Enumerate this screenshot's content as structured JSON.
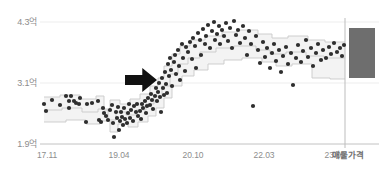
{
  "chart_data": {
    "type": "scatter",
    "title": "",
    "subtitle": "",
    "xlabel": "",
    "ylabel": "",
    "grid": true,
    "legend_position": "none",
    "xlim": [
      "17.11",
      "24.03"
    ],
    "ylim": [
      1.9,
      4.3
    ],
    "y_unit": "억",
    "y_ticks": [
      {
        "value": 4.3,
        "label": "4.3억",
        "pixel_y": 22
      },
      {
        "value": 3.1,
        "label": "3.1억",
        "pixel_y": 83
      },
      {
        "value": 1.9,
        "label": "1.9억",
        "pixel_y": 144
      }
    ],
    "x_ticks": [
      {
        "label": "17.11",
        "pixel_x": 46
      },
      {
        "label": "19.04",
        "pixel_x": 118
      },
      {
        "label": "20.10",
        "pixel_x": 192
      },
      {
        "label": "22.03",
        "pixel_x": 263
      },
      {
        "label": "23.09",
        "pixel_x": 334
      }
    ],
    "x_axis_end_label": "매물가격",
    "colors": {
      "point": "#2e2e2e",
      "step_line": "#c9c9c9",
      "band_fill": "#f3f3f3",
      "gridline": "#ededed",
      "axis_line": "#d6d6d6",
      "tick_text": "#8d8d8d",
      "arrow": "#111111",
      "listing_bar": "#6e6e6e",
      "divider": "#bdbdbd",
      "background": "#ffffff"
    },
    "annotations": [
      {
        "name": "trend-arrow",
        "shape": "right-arrow",
        "color": "#111111",
        "x": 125,
        "y": 68,
        "width": 32,
        "height": 24
      }
    ],
    "listing_price_bar": {
      "label": "매물가격",
      "x": 349,
      "width": 26,
      "top_value": 4.08,
      "bottom_value": 3.45,
      "top_pixel_y": 28,
      "bottom_pixel_y": 78,
      "color": "#6e6e6e"
    },
    "divider_line": {
      "pixel_x": 345,
      "top": 18,
      "bottom": 148
    },
    "series": [
      {
        "name": "실거래가",
        "type": "scatter",
        "marker": "circle",
        "marker_size": 3,
        "color": "#2e2e2e",
        "points": [
          [
            44,
            104
          ],
          [
            46,
            111
          ],
          [
            52,
            100
          ],
          [
            60,
            105
          ],
          [
            66,
            96
          ],
          [
            69,
            101
          ],
          [
            69,
            108
          ],
          [
            71,
            96
          ],
          [
            74,
            101
          ],
          [
            76,
            103
          ],
          [
            79,
            104
          ],
          [
            80,
            98
          ],
          [
            86,
            122
          ],
          [
            87,
            104
          ],
          [
            92,
            103
          ],
          [
            98,
            101
          ],
          [
            99,
            120
          ],
          [
            101,
            122
          ],
          [
            103,
            108
          ],
          [
            104,
            113
          ],
          [
            106,
            116
          ],
          [
            108,
            120
          ],
          [
            110,
            110
          ],
          [
            112,
            105
          ],
          [
            113,
            123
          ],
          [
            114,
            137
          ],
          [
            116,
            112
          ],
          [
            117,
            118
          ],
          [
            118,
            107
          ],
          [
            119,
            130
          ],
          [
            120,
            121
          ],
          [
            121,
            112
          ],
          [
            122,
            117
          ],
          [
            123,
            125
          ],
          [
            124,
            108
          ],
          [
            125,
            119
          ],
          [
            127,
            123
          ],
          [
            128,
            113
          ],
          [
            129,
            104
          ],
          [
            130,
            118
          ],
          [
            131,
            110
          ],
          [
            133,
            121
          ],
          [
            134,
            106
          ],
          [
            136,
            112
          ],
          [
            137,
            104
          ],
          [
            138,
            116
          ],
          [
            140,
            111
          ],
          [
            141,
            119
          ],
          [
            142,
            104
          ],
          [
            143,
            108
          ],
          [
            145,
            101
          ],
          [
            146,
            113
          ],
          [
            147,
            106
          ],
          [
            148,
            98
          ],
          [
            150,
            105
          ],
          [
            151,
            94
          ],
          [
            152,
            100
          ],
          [
            153,
            109
          ],
          [
            155,
            96
          ],
          [
            156,
            88
          ],
          [
            157,
            101
          ],
          [
            158,
            92
          ],
          [
            159,
            83
          ],
          [
            160,
            97
          ],
          [
            161,
            112
          ],
          [
            162,
            78
          ],
          [
            163,
            88
          ],
          [
            164,
            95
          ],
          [
            165,
            72
          ],
          [
            166,
            84
          ],
          [
            167,
            93
          ],
          [
            168,
            64
          ],
          [
            169,
            76
          ],
          [
            170,
            58
          ],
          [
            171,
            70
          ],
          [
            172,
            86
          ],
          [
            174,
            62
          ],
          [
            175,
            55
          ],
          [
            176,
            74
          ],
          [
            178,
            50
          ],
          [
            179,
            66
          ],
          [
            180,
            80
          ],
          [
            182,
            44
          ],
          [
            183,
            58
          ],
          [
            185,
            71
          ],
          [
            186,
            47
          ],
          [
            188,
            52
          ],
          [
            190,
            42
          ],
          [
            192,
            59
          ],
          [
            193,
            38
          ],
          [
            195,
            46
          ],
          [
            196,
            68
          ],
          [
            198,
            33
          ],
          [
            200,
            40
          ],
          [
            201,
            55
          ],
          [
            203,
            29
          ],
          [
            205,
            44
          ],
          [
            206,
            36
          ],
          [
            208,
            25
          ],
          [
            210,
            48
          ],
          [
            212,
            31
          ],
          [
            214,
            22
          ],
          [
            215,
            40
          ],
          [
            217,
            34
          ],
          [
            219,
            26
          ],
          [
            220,
            44
          ],
          [
            222,
            30
          ],
          [
            224,
            36
          ],
          [
            226,
            23
          ],
          [
            228,
            41
          ],
          [
            230,
            28
          ],
          [
            232,
            48
          ],
          [
            234,
            21
          ],
          [
            236,
            35
          ],
          [
            238,
            30
          ],
          [
            240,
            43
          ],
          [
            243,
            26
          ],
          [
            245,
            38
          ],
          [
            247,
            55
          ],
          [
            249,
            31
          ],
          [
            251,
            44
          ],
          [
            253,
            106
          ],
          [
            256,
            36
          ],
          [
            258,
            50
          ],
          [
            260,
            63
          ],
          [
            263,
            42
          ],
          [
            265,
            57
          ],
          [
            267,
            48
          ],
          [
            270,
            68
          ],
          [
            272,
            53
          ],
          [
            274,
            44
          ],
          [
            276,
            61
          ],
          [
            279,
            50
          ],
          [
            281,
            72
          ],
          [
            283,
            56
          ],
          [
            286,
            47
          ],
          [
            288,
            64
          ],
          [
            291,
            53
          ],
          [
            293,
            85
          ],
          [
            296,
            58
          ],
          [
            298,
            45
          ],
          [
            301,
            62
          ],
          [
            303,
            51
          ],
          [
            306,
            40
          ],
          [
            308,
            57
          ],
          [
            311,
            48
          ],
          [
            313,
            66
          ],
          [
            316,
            53
          ],
          [
            318,
            44
          ],
          [
            321,
            60
          ],
          [
            323,
            50
          ],
          [
            326,
            58
          ],
          [
            329,
            47
          ],
          [
            331,
            54
          ],
          [
            334,
            43
          ],
          [
            337,
            52
          ],
          [
            340,
            48
          ],
          [
            342,
            56
          ],
          [
            344,
            45
          ]
        ]
      },
      {
        "name": "상한선",
        "type": "step",
        "color": "#c9c9c9",
        "points": [
          [
            44,
            97
          ],
          [
            60,
            97
          ],
          [
            60,
            95
          ],
          [
            80,
            95
          ],
          [
            80,
            99
          ],
          [
            96,
            99
          ],
          [
            96,
            96
          ],
          [
            104,
            96
          ],
          [
            104,
            110
          ],
          [
            110,
            110
          ],
          [
            110,
            100
          ],
          [
            120,
            100
          ],
          [
            120,
            104
          ],
          [
            130,
            104
          ],
          [
            130,
            99
          ],
          [
            140,
            99
          ],
          [
            140,
            94
          ],
          [
            150,
            94
          ],
          [
            150,
            86
          ],
          [
            158,
            86
          ],
          [
            158,
            78
          ],
          [
            164,
            78
          ],
          [
            164,
            66
          ],
          [
            172,
            66
          ],
          [
            172,
            54
          ],
          [
            180,
            54
          ],
          [
            180,
            46
          ],
          [
            190,
            46
          ],
          [
            190,
            40
          ],
          [
            205,
            40
          ],
          [
            205,
            36
          ],
          [
            222,
            36
          ],
          [
            222,
            32
          ],
          [
            238,
            32
          ],
          [
            238,
            30
          ],
          [
            258,
            30
          ],
          [
            258,
            34
          ],
          [
            272,
            34
          ],
          [
            272,
            38
          ],
          [
            288,
            38
          ],
          [
            288,
            36
          ],
          [
            308,
            36
          ],
          [
            308,
            40
          ],
          [
            325,
            40
          ],
          [
            325,
            42
          ],
          [
            345,
            42
          ]
        ]
      },
      {
        "name": "중간값",
        "type": "step",
        "color": "#c9c9c9",
        "points": [
          [
            44,
            110
          ],
          [
            62,
            110
          ],
          [
            62,
            108
          ],
          [
            82,
            108
          ],
          [
            82,
            112
          ],
          [
            98,
            112
          ],
          [
            98,
            109
          ],
          [
            108,
            109
          ],
          [
            108,
            120
          ],
          [
            116,
            120
          ],
          [
            116,
            112
          ],
          [
            126,
            112
          ],
          [
            126,
            115
          ],
          [
            136,
            115
          ],
          [
            136,
            110
          ],
          [
            146,
            110
          ],
          [
            146,
            104
          ],
          [
            154,
            104
          ],
          [
            154,
            96
          ],
          [
            162,
            96
          ],
          [
            162,
            86
          ],
          [
            170,
            86
          ],
          [
            170,
            74
          ],
          [
            178,
            74
          ],
          [
            178,
            64
          ],
          [
            188,
            64
          ],
          [
            188,
            58
          ],
          [
            200,
            58
          ],
          [
            200,
            52
          ],
          [
            216,
            52
          ],
          [
            216,
            48
          ],
          [
            234,
            48
          ],
          [
            234,
            46
          ],
          [
            256,
            46
          ],
          [
            256,
            50
          ],
          [
            270,
            50
          ],
          [
            270,
            54
          ],
          [
            286,
            54
          ],
          [
            286,
            52
          ],
          [
            306,
            52
          ],
          [
            306,
            56
          ],
          [
            324,
            56
          ],
          [
            324,
            58
          ],
          [
            345,
            58
          ]
        ]
      },
      {
        "name": "하한선",
        "type": "step",
        "color": "#c9c9c9",
        "points": [
          [
            44,
            122
          ],
          [
            66,
            122
          ],
          [
            66,
            120
          ],
          [
            86,
            120
          ],
          [
            86,
            124
          ],
          [
            100,
            124
          ],
          [
            100,
            121
          ],
          [
            110,
            121
          ],
          [
            110,
            132
          ],
          [
            118,
            132
          ],
          [
            118,
            124
          ],
          [
            128,
            124
          ],
          [
            128,
            127
          ],
          [
            138,
            127
          ],
          [
            138,
            122
          ],
          [
            148,
            122
          ],
          [
            148,
            116
          ],
          [
            156,
            116
          ],
          [
            156,
            108
          ],
          [
            164,
            108
          ],
          [
            164,
            98
          ],
          [
            172,
            98
          ],
          [
            172,
            86
          ],
          [
            182,
            86
          ],
          [
            182,
            76
          ],
          [
            194,
            76
          ],
          [
            194,
            70
          ],
          [
            208,
            70
          ],
          [
            208,
            64
          ],
          [
            224,
            64
          ],
          [
            224,
            60
          ],
          [
            242,
            60
          ],
          [
            242,
            58
          ],
          [
            262,
            58
          ],
          [
            262,
            62
          ],
          [
            276,
            62
          ],
          [
            276,
            66
          ],
          [
            292,
            66
          ],
          [
            292,
            64
          ],
          [
            312,
            64
          ],
          [
            312,
            78
          ],
          [
            330,
            78
          ],
          [
            330,
            79
          ],
          [
            345,
            79
          ]
        ]
      }
    ]
  }
}
